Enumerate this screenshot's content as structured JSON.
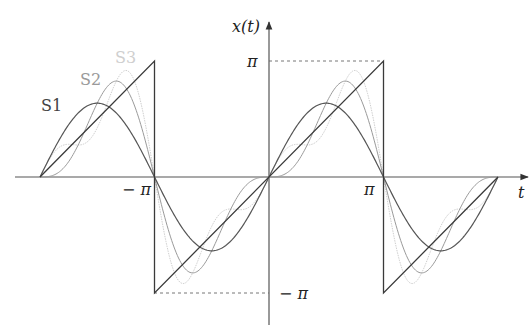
{
  "chart_data": {
    "type": "line",
    "title": "",
    "xlabel": "t",
    "ylabel": "x(t)",
    "x_ticks": [
      {
        "value": -3.14159,
        "label": "− π"
      },
      {
        "value": 3.14159,
        "label": "π"
      }
    ],
    "y_ticks": [
      {
        "value": 3.14159,
        "label": "π"
      },
      {
        "value": -3.14159,
        "label": "− π"
      }
    ],
    "xlim": [
      -6.2832,
      6.2832
    ],
    "ylim": [
      -3.1416,
      3.1416
    ],
    "grid": false,
    "series": [
      {
        "name": "x(t)",
        "kind": "sawtooth",
        "description": "x(t) = t on (-π, π), periodic with period 2π",
        "color": "#3a3a3a",
        "x": [
          -6.2832,
          -3.1416,
          -3.1416,
          3.1416,
          3.1416,
          6.2832
        ],
        "y": [
          0,
          3.1416,
          -3.1416,
          3.1416,
          -3.1416,
          0
        ]
      },
      {
        "name": "S1",
        "formula": "2 sin t",
        "color": "#555555",
        "label_pos": [
          41,
          105
        ]
      },
      {
        "name": "S2",
        "formula": "2(sin t − sin 2t / 2)",
        "color": "#9a9a9a",
        "label_pos": [
          80,
          80
        ]
      },
      {
        "name": "S3",
        "formula": "2(sin t − sin 2t / 2 + sin 3t / 3)",
        "color": "#cfcfcf",
        "label_pos": [
          115,
          58
        ]
      }
    ],
    "annotations": [
      {
        "type": "dashed-line",
        "from": [
          0,
          3.1416
        ],
        "to": [
          3.1416,
          3.1416
        ]
      },
      {
        "type": "dashed-line",
        "from": [
          -3.1416,
          -3.1416
        ],
        "to": [
          0,
          -3.1416
        ]
      }
    ]
  },
  "labels": {
    "y_axis": "x(t)",
    "x_axis": "t",
    "pi": "π",
    "neg_pi_x": "− π",
    "neg_pi_y": "− π",
    "s1": "S1",
    "s2": "S2",
    "s3": "S3"
  }
}
